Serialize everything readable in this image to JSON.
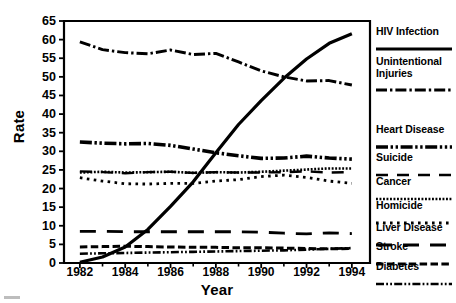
{
  "chart_data": {
    "type": "line",
    "title": "",
    "xlabel": "Year",
    "ylabel": "Rate",
    "xlim": [
      1981.3,
      1994.8
    ],
    "ylim": [
      0,
      65
    ],
    "yticks": [
      0,
      5,
      10,
      15,
      20,
      25,
      30,
      35,
      40,
      45,
      50,
      55,
      60,
      65
    ],
    "xticks": [
      1982,
      1984,
      1986,
      1988,
      1990,
      1992,
      1994
    ],
    "xtick_labels": [
      "1982",
      "1984",
      "1986",
      "1988",
      "1990",
      "1992",
      "1994"
    ],
    "minor_xticks": [
      1983,
      1985,
      1987,
      1989,
      1991,
      1993
    ],
    "grid": false,
    "legend_position": "right",
    "x": [
      1982,
      1983,
      1984,
      1985,
      1986,
      1987,
      1988,
      1989,
      1990,
      1991,
      1992,
      1993,
      1994
    ],
    "series": [
      {
        "name": "HIV Infection",
        "style": "solid",
        "values": [
          0.2,
          1.6,
          4.3,
          9.0,
          15.2,
          21.8,
          29.6,
          37.2,
          43.6,
          49.6,
          54.8,
          59.0,
          61.6
        ]
      },
      {
        "name": "Unintentional Injuries",
        "style": "dash-dot",
        "values": [
          59.4,
          57.3,
          56.5,
          56.2,
          57.2,
          56.0,
          56.3,
          54.0,
          51.6,
          50.0,
          48.9,
          49.0,
          47.8
        ]
      },
      {
        "name": "Heart Disease",
        "style": "dash-dot-dot",
        "values": [
          32.5,
          32.2,
          32.0,
          32.1,
          31.6,
          30.6,
          29.6,
          28.8,
          28.1,
          28.2,
          28.7,
          28.2,
          27.9
        ]
      },
      {
        "name": "Suicide",
        "style": "long-dash",
        "values": [
          24.6,
          24.4,
          24.1,
          24.4,
          24.5,
          24.2,
          24.4,
          24.3,
          24.3,
          24.4,
          24.6,
          24.3,
          24.4
        ]
      },
      {
        "name": "Cancer",
        "style": "fine-dot",
        "values": [
          24.3,
          24.5,
          24.3,
          24.4,
          24.5,
          24.2,
          24.4,
          24.3,
          24.5,
          24.8,
          25.1,
          25.4,
          25.4
        ]
      },
      {
        "name": "Homicide",
        "style": "coarse-dot",
        "values": [
          22.9,
          22.0,
          21.3,
          21.2,
          21.4,
          21.4,
          22.0,
          22.4,
          23.2,
          23.6,
          23.0,
          22.0,
          21.4
        ]
      },
      {
        "name": "Liver Disease",
        "style": "long-dash-wide",
        "values": [
          8.5,
          8.5,
          8.4,
          8.4,
          8.4,
          8.4,
          8.4,
          8.4,
          8.3,
          8.0,
          7.8,
          8.1,
          7.9
        ]
      },
      {
        "name": "Stroke",
        "style": "med-dash",
        "values": [
          4.3,
          4.4,
          4.5,
          4.4,
          4.3,
          4.2,
          4.2,
          4.1,
          4.1,
          4.0,
          3.9,
          3.8,
          3.9
        ]
      },
      {
        "name": "Diabetes",
        "style": "dash-dot-dot-thin",
        "values": [
          2.5,
          2.6,
          2.7,
          2.8,
          2.9,
          3.0,
          3.1,
          3.2,
          3.3,
          3.4,
          3.6,
          3.8,
          4.0
        ]
      }
    ]
  },
  "axes": {
    "ylabel": "Rate",
    "xlabel": "Year"
  },
  "legend": {
    "items": [
      {
        "label": "HIV Infection",
        "style": "solid"
      },
      {
        "label": "Unintentional\nInjuries",
        "style": "dash-dot"
      },
      {
        "label": "Heart Disease",
        "style": "dash-dot-dot"
      },
      {
        "label": "Suicide",
        "style": "long-dash"
      },
      {
        "label": "Cancer",
        "style": "fine-dot"
      },
      {
        "label": "Homicide",
        "style": "coarse-dot"
      },
      {
        "label": "Liver Disease",
        "style": "long-dash-wide"
      },
      {
        "label": "Stroke",
        "style": "med-dash"
      },
      {
        "label": "Diabetes",
        "style": "dash-dot-dot-thin"
      }
    ]
  },
  "colors": {
    "ink": "#000000",
    "background": "#ffffff"
  }
}
